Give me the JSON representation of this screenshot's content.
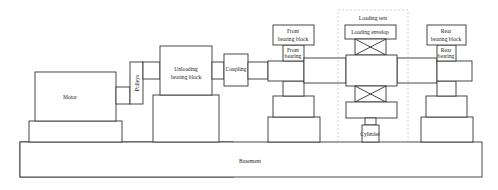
{
  "diagram": {
    "labels": {
      "motor": "Motor",
      "pulleys": "Pulleys",
      "unloading_bearing_block_line1": "Unloading",
      "unloading_bearing_block_line2": "bearing block",
      "coupling": "Coupling",
      "front_bearing_block_line1": "Front",
      "front_bearing_block_line2": "bearing block",
      "front_bearing_line1": "Front",
      "front_bearing_line2": "bearing",
      "loading_sets": "Loading sets",
      "loading_envelop": "Loading envelop",
      "rear_bearing_block_line1": "Rear",
      "rear_bearing_block_line2": "bearing block",
      "rear_bearing_line1": "Rear",
      "rear_bearing_line2": "bearing",
      "cylinder": "Cylinder",
      "basement": "Basement"
    }
  }
}
